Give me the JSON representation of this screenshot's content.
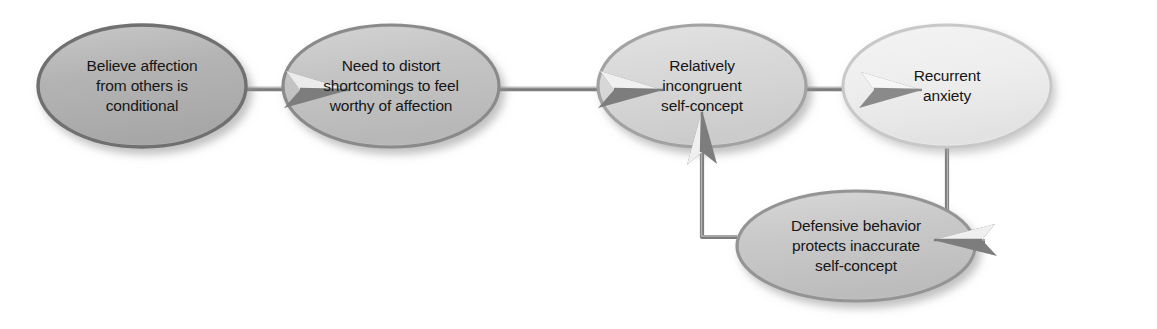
{
  "diagram": {
    "type": "flowchart",
    "background": "#ffffff",
    "text_color": "#161616",
    "connector_color": "#7d7d7d",
    "nodes": [
      {
        "id": "believe-affection-conditional",
        "label": "Believe affection\nfrom others is\nconditional",
        "fill": "#b0b0b0",
        "rim": "#6f6f6f",
        "cx": 142,
        "cy": 86,
        "rx": 104,
        "ry": 61
      },
      {
        "id": "need-to-distort",
        "label": "Need to distort\nshortcomings to feel\nworthy of affection",
        "fill": "#c1c1c1",
        "rim": "#8a8a8a",
        "cx": 391,
        "cy": 86,
        "rx": 108,
        "ry": 61
      },
      {
        "id": "relatively-incongruent-self-concept",
        "label": "Relatively\nincongruent\nself-concept",
        "fill": "#d6d6d6",
        "rim": "#a2a2a2",
        "cx": 702,
        "cy": 86,
        "rx": 104,
        "ry": 61
      },
      {
        "id": "recurrent-anxiety",
        "label": "Recurrent\nanxiety",
        "fill": "#eeeeee",
        "rim": "#c4c4c4",
        "cx": 947,
        "cy": 86,
        "rx": 104,
        "ry": 61
      },
      {
        "id": "defensive-behavior",
        "label": "Defensive behavior\nprotects inaccurate\nself-concept",
        "fill": "#c6c6c6",
        "rim": "#949494",
        "cx": 856,
        "cy": 246,
        "rx": 119,
        "ry": 55
      }
    ],
    "connectors": [
      {
        "id": "arrow-believe-to-need",
        "from": "believe-affection-conditional",
        "to": "need-to-distort",
        "style": "straight",
        "direction": "right"
      },
      {
        "id": "arrow-need-to-incongruent",
        "from": "need-to-distort",
        "to": "relatively-incongruent-self-concept",
        "style": "straight",
        "direction": "right"
      },
      {
        "id": "arrow-incongruent-to-anxiety",
        "from": "relatively-incongruent-self-concept",
        "to": "recurrent-anxiety",
        "style": "straight",
        "direction": "right"
      },
      {
        "id": "arrow-anxiety-to-defensive",
        "from": "recurrent-anxiety",
        "to": "defensive-behavior",
        "style": "elbow",
        "direction": "down-left"
      },
      {
        "id": "arrow-defensive-to-incongruent",
        "from": "defensive-behavior",
        "to": "relatively-incongruent-self-concept",
        "style": "elbow",
        "direction": "left-up"
      }
    ]
  }
}
